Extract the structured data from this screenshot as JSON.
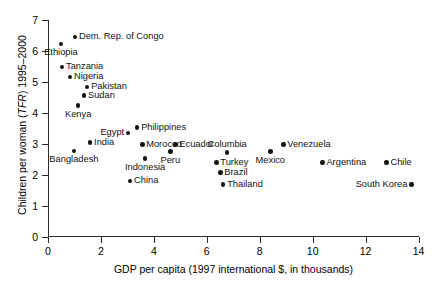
{
  "chart_data": {
    "type": "scatter",
    "title": "",
    "xlabel": "GDP per capita (1997 international $, in thousands)",
    "ylabel_plain": "Children per woman (TFR) 1995–2000",
    "ylabel_pre": "Children per woman (",
    "ylabel_italic": "TFR",
    "ylabel_post": ") 1995–2000",
    "xlim": [
      0,
      14
    ],
    "ylim": [
      0,
      7
    ],
    "xticks": [
      0,
      2,
      4,
      6,
      8,
      10,
      12,
      14
    ],
    "xtick_labels": [
      "0",
      "2",
      "4",
      "6",
      "8",
      "10",
      "12",
      "14"
    ],
    "yticks": [
      0,
      1,
      2,
      3,
      4,
      5,
      6,
      7
    ],
    "ytick_labels": [
      "0",
      "1",
      "2",
      "3",
      "4",
      "5",
      "6",
      "7"
    ],
    "grid": false,
    "legend": "none",
    "points": [
      {
        "label": "Dem. Rep. of Congo",
        "x": 1.02,
        "y": 6.45,
        "pos": "right"
      },
      {
        "label": "Ethiopia",
        "x": 0.49,
        "y": 6.23,
        "pos": "below"
      },
      {
        "label": "Tanzania",
        "x": 0.53,
        "y": 5.48,
        "pos": "right"
      },
      {
        "label": "Nigeria",
        "x": 0.83,
        "y": 5.16,
        "pos": "right"
      },
      {
        "label": "Pakistan",
        "x": 1.48,
        "y": 4.84,
        "pos": "right"
      },
      {
        "label": "Sudan",
        "x": 1.36,
        "y": 4.55,
        "pos": "right"
      },
      {
        "label": "Kenya",
        "x": 1.14,
        "y": 4.23,
        "pos": "below"
      },
      {
        "label": "Egypt",
        "x": 3.03,
        "y": 3.35,
        "pos": "left"
      },
      {
        "label": "Philippines",
        "x": 3.37,
        "y": 3.52,
        "pos": "right"
      },
      {
        "label": "India",
        "x": 1.59,
        "y": 3.03,
        "pos": "right"
      },
      {
        "label": "Morocco",
        "x": 3.56,
        "y": 2.97,
        "pos": "right"
      },
      {
        "label": "Ecuador",
        "x": 4.81,
        "y": 2.97,
        "pos": "right"
      },
      {
        "label": "Peru",
        "x": 4.62,
        "y": 2.74,
        "pos": "below"
      },
      {
        "label": "Indonesia",
        "x": 3.67,
        "y": 2.52,
        "pos": "below"
      },
      {
        "label": "Bangladesh",
        "x": 0.98,
        "y": 2.77,
        "pos": "below"
      },
      {
        "label": "China",
        "x": 3.1,
        "y": 1.8,
        "pos": "right"
      },
      {
        "label": "Columbia",
        "x": 6.77,
        "y": 2.71,
        "pos": "above"
      },
      {
        "label": "Turkey",
        "x": 6.36,
        "y": 2.39,
        "pos": "right"
      },
      {
        "label": "Brazil",
        "x": 6.51,
        "y": 2.06,
        "pos": "right"
      },
      {
        "label": "Thailand",
        "x": 6.62,
        "y": 1.68,
        "pos": "right"
      },
      {
        "label": "Venezuela",
        "x": 8.89,
        "y": 2.97,
        "pos": "right"
      },
      {
        "label": "Mexico",
        "x": 8.4,
        "y": 2.74,
        "pos": "below"
      },
      {
        "label": "Argentina",
        "x": 10.37,
        "y": 2.39,
        "pos": "right"
      },
      {
        "label": "Chile",
        "x": 12.79,
        "y": 2.39,
        "pos": "right"
      },
      {
        "label": "South Korea",
        "x": 13.73,
        "y": 1.68,
        "pos": "left"
      }
    ]
  }
}
